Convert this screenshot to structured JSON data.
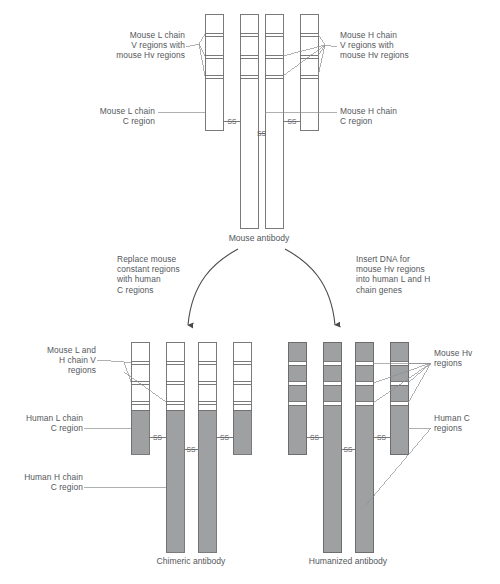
{
  "figure": {
    "stroke_color": "#6b6b6b",
    "text_color": "#54585c",
    "mouse_fill": "#ffffff",
    "human_fill": "#9ea0a2",
    "hv_band_fill": "#ffffff",
    "leader_color": "#8c8f92"
  },
  "top_panel": {
    "caption": "Mouse antibody",
    "labels": {
      "left_v": "Mouse L chain\nV regions with\nmouse Hv regions",
      "left_c": "Mouse L chain\nC region",
      "right_v": "Mouse H chain\nV regions with\nmouse Hv regions",
      "right_c": "Mouse H chain\nC region"
    },
    "disulfide_label": "SS",
    "disulfide_count": 3,
    "chains": [
      {
        "name": "light-chain-left",
        "type": "L",
        "fill": "mouse",
        "hv_bands": 3
      },
      {
        "name": "heavy-chain-left",
        "type": "H",
        "fill": "mouse",
        "hv_bands": 3
      },
      {
        "name": "heavy-chain-right",
        "type": "H",
        "fill": "mouse",
        "hv_bands": 3
      },
      {
        "name": "light-chain-right",
        "type": "L",
        "fill": "mouse",
        "hv_bands": 3
      }
    ]
  },
  "arrows": {
    "left": {
      "text": "Replace mouse\nconstant regions\nwith human\nC regions"
    },
    "right": {
      "text": "Insert DNA for\nmouse Hv regions\ninto human L and H\nchain genes"
    }
  },
  "chimeric_panel": {
    "caption": "Chimeric antibody",
    "labels": {
      "v_regions": "Mouse L and\nH chain V\nregions",
      "light_c": "Human L chain\nC region",
      "heavy_c": "Human H chain\nC region"
    },
    "disulfide_label": "SS",
    "disulfide_count": 3,
    "chains": [
      {
        "name": "light-chain-left",
        "type": "L",
        "v_fill": "mouse",
        "c_fill": "human",
        "hv_bands": 3
      },
      {
        "name": "heavy-chain-left",
        "type": "H",
        "v_fill": "mouse",
        "c_fill": "human",
        "hv_bands": 3
      },
      {
        "name": "heavy-chain-right",
        "type": "H",
        "v_fill": "mouse",
        "c_fill": "human",
        "hv_bands": 3
      },
      {
        "name": "light-chain-right",
        "type": "L",
        "v_fill": "mouse",
        "c_fill": "human",
        "hv_bands": 3
      }
    ]
  },
  "humanized_panel": {
    "caption": "Humanized antibody",
    "labels": {
      "hv_regions": "Mouse Hv\nregions",
      "human_c": "Human C\nregions"
    },
    "disulfide_label": "SS",
    "disulfide_count": 3,
    "chains": [
      {
        "name": "light-chain-left",
        "type": "L",
        "fill": "human",
        "hv_bands": 3
      },
      {
        "name": "heavy-chain-left",
        "type": "H",
        "fill": "human",
        "hv_bands": 3
      },
      {
        "name": "heavy-chain-right",
        "type": "H",
        "fill": "human",
        "hv_bands": 3
      },
      {
        "name": "light-chain-right",
        "type": "L",
        "fill": "human",
        "hv_bands": 3
      }
    ]
  },
  "bottom_caption": {
    "text": ""
  }
}
